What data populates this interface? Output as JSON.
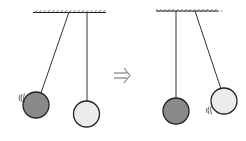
{
  "diagram": {
    "arrow_symbol": "⇒",
    "colors": {
      "dark_ball": "#8a8a8a",
      "light_ball": "#ececec",
      "stroke": "#2a2a2a",
      "background": "#ffffff"
    },
    "panels": [
      {
        "name": "before",
        "moving_ball": "dark",
        "resting_ball": "light"
      },
      {
        "name": "after",
        "moving_ball": "light",
        "resting_ball": "dark"
      }
    ]
  }
}
